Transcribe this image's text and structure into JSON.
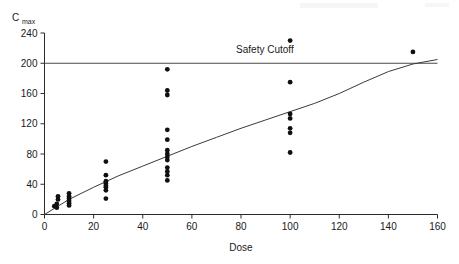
{
  "chart_data": {
    "type": "scatter",
    "title": "",
    "xlabel": "Dose",
    "ylabel": "Cmax",
    "ylabel_display": "C",
    "ylabel_subscript": "max",
    "xlim": [
      0,
      160
    ],
    "ylim": [
      0,
      240
    ],
    "xticks": [
      0,
      20,
      40,
      60,
      80,
      100,
      120,
      140,
      160
    ],
    "yticks": [
      0,
      40,
      80,
      120,
      160,
      200,
      240
    ],
    "grid": false,
    "legend": null,
    "annotations": [
      {
        "name": "safety-cutoff-label",
        "text": "Safety Cutoff",
        "x": 78,
        "y": 213
      }
    ],
    "reference_lines": [
      {
        "name": "safety-cutoff-line",
        "orientation": "horizontal",
        "value": 200,
        "label": "Safety Cutoff",
        "color": "#4a4a4a"
      }
    ],
    "series": [
      {
        "name": "observations",
        "type": "scatter",
        "marker": "filled-circle",
        "color": "#101010",
        "points": [
          {
            "x": 4,
            "y": 11
          },
          {
            "x": 5,
            "y": 9
          },
          {
            "x": 5,
            "y": 14
          },
          {
            "x": 5.5,
            "y": 20
          },
          {
            "x": 5.5,
            "y": 24
          },
          {
            "x": 10,
            "y": 12
          },
          {
            "x": 10,
            "y": 15
          },
          {
            "x": 10,
            "y": 18
          },
          {
            "x": 10,
            "y": 21
          },
          {
            "x": 10,
            "y": 24
          },
          {
            "x": 10,
            "y": 28
          },
          {
            "x": 25,
            "y": 21
          },
          {
            "x": 25,
            "y": 32
          },
          {
            "x": 25,
            "y": 36
          },
          {
            "x": 25,
            "y": 38
          },
          {
            "x": 25,
            "y": 41
          },
          {
            "x": 25,
            "y": 44
          },
          {
            "x": 25,
            "y": 52
          },
          {
            "x": 25,
            "y": 70
          },
          {
            "x": 50,
            "y": 45
          },
          {
            "x": 50,
            "y": 52
          },
          {
            "x": 50,
            "y": 57
          },
          {
            "x": 50,
            "y": 62
          },
          {
            "x": 50,
            "y": 72
          },
          {
            "x": 50,
            "y": 76
          },
          {
            "x": 50,
            "y": 80
          },
          {
            "x": 50,
            "y": 85
          },
          {
            "x": 50,
            "y": 99
          },
          {
            "x": 50,
            "y": 112
          },
          {
            "x": 50,
            "y": 158
          },
          {
            "x": 50,
            "y": 164
          },
          {
            "x": 50,
            "y": 192
          },
          {
            "x": 100,
            "y": 82
          },
          {
            "x": 100,
            "y": 108
          },
          {
            "x": 100,
            "y": 114
          },
          {
            "x": 100,
            "y": 127
          },
          {
            "x": 100,
            "y": 133
          },
          {
            "x": 100,
            "y": 175
          },
          {
            "x": 100,
            "y": 230
          },
          {
            "x": 150,
            "y": 215
          }
        ]
      },
      {
        "name": "fitted-curve",
        "type": "line",
        "color": "#3a3a3a",
        "points": [
          {
            "x": 0,
            "y": 0
          },
          {
            "x": 10,
            "y": 20
          },
          {
            "x": 20,
            "y": 36
          },
          {
            "x": 30,
            "y": 51
          },
          {
            "x": 40,
            "y": 64
          },
          {
            "x": 50,
            "y": 77
          },
          {
            "x": 60,
            "y": 90
          },
          {
            "x": 70,
            "y": 102
          },
          {
            "x": 80,
            "y": 114
          },
          {
            "x": 90,
            "y": 125
          },
          {
            "x": 100,
            "y": 136
          },
          {
            "x": 110,
            "y": 147
          },
          {
            "x": 120,
            "y": 160
          },
          {
            "x": 130,
            "y": 175
          },
          {
            "x": 140,
            "y": 189
          },
          {
            "x": 150,
            "y": 199
          },
          {
            "x": 160,
            "y": 205
          }
        ]
      }
    ]
  },
  "figure": {
    "background_color": "#ffffff",
    "axis_color": "#2b2b2b",
    "point_color": "#101010",
    "curve_color": "#3a3a3a",
    "cutoff_color": "#4a4a4a"
  }
}
